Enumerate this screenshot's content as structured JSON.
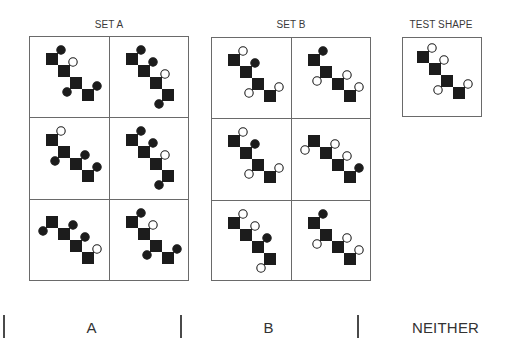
{
  "colors": {
    "shape": "#1c1c1c",
    "open_fill": "#ffffff",
    "border": "#6a6a6a",
    "text": "#333333"
  },
  "sets": [
    {
      "label": "SET A",
      "cells": [
        {
          "circles": [
            {
              "sq": 0,
              "corner": "tr",
              "fill": "filled"
            },
            {
              "sq": 1,
              "corner": "tr",
              "fill": "open"
            },
            {
              "sq": 2,
              "corner": "bl",
              "fill": "filled"
            },
            {
              "sq": 3,
              "corner": "tr",
              "fill": "filled"
            }
          ]
        },
        {
          "circles": [
            {
              "sq": 0,
              "corner": "tr",
              "fill": "filled"
            },
            {
              "sq": 1,
              "corner": "tr",
              "fill": "filled"
            },
            {
              "sq": 2,
              "corner": "tr",
              "fill": "open"
            },
            {
              "sq": 3,
              "corner": "bl",
              "fill": "filled"
            }
          ]
        },
        {
          "circles": [
            {
              "sq": 0,
              "corner": "tr",
              "fill": "open"
            },
            {
              "sq": 1,
              "corner": "bl",
              "fill": "filled"
            },
            {
              "sq": 2,
              "corner": "tr",
              "fill": "filled"
            },
            {
              "sq": 3,
              "corner": "tr",
              "fill": "filled"
            }
          ]
        },
        {
          "circles": [
            {
              "sq": 0,
              "corner": "tr",
              "fill": "filled"
            },
            {
              "sq": 1,
              "corner": "tr",
              "fill": "filled"
            },
            {
              "sq": 2,
              "corner": "tr",
              "fill": "open"
            },
            {
              "sq": 3,
              "corner": "bl",
              "fill": "filled"
            }
          ]
        },
        {
          "circles": [
            {
              "sq": 0,
              "corner": "bl",
              "fill": "filled"
            },
            {
              "sq": 1,
              "corner": "tr",
              "fill": "filled"
            },
            {
              "sq": 2,
              "corner": "tr",
              "fill": "filled"
            },
            {
              "sq": 3,
              "corner": "tr",
              "fill": "open"
            }
          ]
        },
        {
          "circles": [
            {
              "sq": 0,
              "corner": "tr",
              "fill": "filled"
            },
            {
              "sq": 1,
              "corner": "tr",
              "fill": "open"
            },
            {
              "sq": 2,
              "corner": "bl",
              "fill": "filled"
            },
            {
              "sq": 3,
              "corner": "tr",
              "fill": "filled"
            }
          ]
        }
      ]
    },
    {
      "label": "SET B",
      "cells": [
        {
          "circles": [
            {
              "sq": 0,
              "corner": "tr",
              "fill": "open"
            },
            {
              "sq": 1,
              "corner": "tr",
              "fill": "filled"
            },
            {
              "sq": 2,
              "corner": "bl",
              "fill": "open"
            },
            {
              "sq": 3,
              "corner": "tr",
              "fill": "open"
            }
          ]
        },
        {
          "circles": [
            {
              "sq": 0,
              "corner": "tr",
              "fill": "filled"
            },
            {
              "sq": 1,
              "corner": "bl",
              "fill": "open"
            },
            {
              "sq": 2,
              "corner": "tr",
              "fill": "open"
            },
            {
              "sq": 3,
              "corner": "tr",
              "fill": "open"
            }
          ]
        },
        {
          "circles": [
            {
              "sq": 0,
              "corner": "tr",
              "fill": "open"
            },
            {
              "sq": 1,
              "corner": "tr",
              "fill": "filled"
            },
            {
              "sq": 2,
              "corner": "bl",
              "fill": "open"
            },
            {
              "sq": 3,
              "corner": "tr",
              "fill": "open"
            }
          ]
        },
        {
          "circles": [
            {
              "sq": 0,
              "corner": "bl",
              "fill": "open"
            },
            {
              "sq": 1,
              "corner": "tr",
              "fill": "open"
            },
            {
              "sq": 2,
              "corner": "tr",
              "fill": "open"
            },
            {
              "sq": 3,
              "corner": "tr",
              "fill": "filled"
            }
          ]
        },
        {
          "circles": [
            {
              "sq": 0,
              "corner": "tr",
              "fill": "open"
            },
            {
              "sq": 1,
              "corner": "tr",
              "fill": "open"
            },
            {
              "sq": 2,
              "corner": "tr",
              "fill": "filled"
            },
            {
              "sq": 3,
              "corner": "bl",
              "fill": "open"
            }
          ]
        },
        {
          "circles": [
            {
              "sq": 0,
              "corner": "tr",
              "fill": "filled"
            },
            {
              "sq": 1,
              "corner": "bl",
              "fill": "open"
            },
            {
              "sq": 2,
              "corner": "tr",
              "fill": "open"
            },
            {
              "sq": 3,
              "corner": "tr",
              "fill": "open"
            }
          ]
        }
      ]
    }
  ],
  "test": {
    "label": "TEST SHAPE",
    "shape": {
      "circles": [
        {
          "sq": 0,
          "corner": "tr",
          "fill": "open"
        },
        {
          "sq": 1,
          "corner": "tr",
          "fill": "open"
        },
        {
          "sq": 2,
          "corner": "bl",
          "fill": "open"
        },
        {
          "sq": 3,
          "corner": "tr",
          "fill": "open"
        }
      ]
    }
  },
  "answers": [
    {
      "label": "A"
    },
    {
      "label": "B"
    },
    {
      "label": "NEITHER"
    }
  ]
}
